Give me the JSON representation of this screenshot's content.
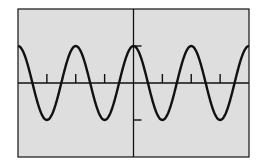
{
  "chart_data": {
    "type": "line",
    "title": "",
    "xlabel": "",
    "ylabel": "",
    "function": "y = cos(x)",
    "xlim": [
      -12.566,
      12.566
    ],
    "ylim": [
      -2,
      2
    ],
    "x_tick_spacing": 3.1416,
    "y_tick_spacing": 1,
    "x_ticks": [
      -9.4248,
      -6.2832,
      -3.1416,
      3.1416,
      6.2832,
      9.4248
    ],
    "y_ticks": [
      -1,
      1
    ],
    "grid": false,
    "legend": null,
    "series": [
      {
        "name": "cos(x)",
        "x": [
          -12.566,
          -9.425,
          -6.283,
          -3.142,
          0,
          3.142,
          6.283,
          9.425,
          12.566
        ],
        "values": [
          1,
          -1,
          1,
          -1,
          1,
          -1,
          1,
          -1,
          1
        ]
      }
    ]
  },
  "colors": {
    "background": "#dedede",
    "frame": "#111111",
    "curve": "#111111",
    "axes": "#111111",
    "page": "#ffffff"
  },
  "layout": {
    "frame": {
      "x": 18,
      "y": 9,
      "w": 231,
      "h": 148
    },
    "origin": {
      "x": 133,
      "y": 82
    }
  }
}
